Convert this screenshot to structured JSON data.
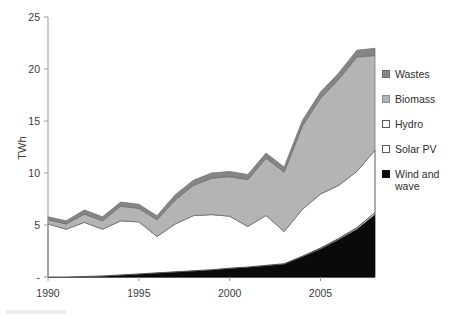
{
  "chart_data": {
    "type": "area",
    "title": "",
    "subtitle": "",
    "xlabel": "",
    "ylabel": "TWh",
    "stacked": true,
    "grid": false,
    "legend_position": "right",
    "xlim": [
      1990,
      2008
    ],
    "ylim": [
      0,
      25
    ],
    "ytick_labels": [
      "25",
      "20",
      "15",
      "10",
      "5",
      "-"
    ],
    "ytick_values": [
      25,
      20,
      15,
      10,
      5,
      0
    ],
    "xtick_labels": [
      "1990",
      "1995",
      "2000",
      "2005"
    ],
    "xtick_values": [
      1990,
      1995,
      2000,
      2005
    ],
    "x": [
      1990,
      1991,
      1992,
      1993,
      1994,
      1995,
      1996,
      1997,
      1998,
      1999,
      2000,
      2001,
      2002,
      2003,
      2004,
      2005,
      2006,
      2007,
      2008
    ],
    "series": [
      {
        "name": "Wind and wave",
        "color": "#0a0a0a",
        "values": [
          0.0,
          0.0,
          0.05,
          0.1,
          0.2,
          0.3,
          0.4,
          0.5,
          0.6,
          0.7,
          0.85,
          0.95,
          1.1,
          1.25,
          1.95,
          2.7,
          3.6,
          4.6,
          6.0
        ]
      },
      {
        "name": "Solar PV",
        "color": "#ffffff",
        "values": [
          0.0,
          0.0,
          0.0,
          0.0,
          0.0,
          0.0,
          0.0,
          0.0,
          0.0,
          0.0,
          0.0,
          0.01,
          0.02,
          0.03,
          0.05,
          0.08,
          0.11,
          0.15,
          0.2
        ]
      },
      {
        "name": "Hydro",
        "color": "#ffffff",
        "values": [
          5.1,
          4.6,
          5.2,
          4.5,
          5.2,
          5.0,
          3.5,
          4.6,
          5.3,
          5.3,
          5.0,
          3.9,
          4.8,
          3.1,
          4.5,
          5.2,
          5.1,
          5.4,
          6.0
        ]
      },
      {
        "name": "Biomass",
        "color": "#b4b4b4",
        "values": [
          0.4,
          0.5,
          0.8,
          0.8,
          1.4,
          1.3,
          1.6,
          2.3,
          2.9,
          3.5,
          3.8,
          4.5,
          5.5,
          5.7,
          8.0,
          9.2,
          10.2,
          11.0,
          9.1
        ]
      },
      {
        "name": "Wastes",
        "color": "#858585",
        "values": [
          0.3,
          0.3,
          0.4,
          0.4,
          0.4,
          0.4,
          0.4,
          0.5,
          0.5,
          0.5,
          0.5,
          0.5,
          0.5,
          0.5,
          0.55,
          0.6,
          0.6,
          0.65,
          0.7
        ]
      }
    ],
    "totals": [
      5.8,
      5.4,
      6.45,
      5.8,
      7.2,
      7.0,
      5.9,
      7.9,
      9.3,
      10.0,
      10.15,
      9.86,
      11.92,
      10.58,
      15.05,
      17.78,
      19.61,
      21.8,
      22.0
    ]
  },
  "axis": {
    "y_title": "TWh",
    "y_ticks": [
      "25",
      "20",
      "15",
      "10",
      "5",
      "-"
    ],
    "x_ticks": [
      "1990",
      "1995",
      "2000",
      "2005"
    ]
  },
  "legend": {
    "items": [
      {
        "label": "Wastes",
        "swatch": "filled-dark-gray",
        "color": "#858585",
        "border": "#6f6f6f"
      },
      {
        "label": "Biomass",
        "swatch": "filled-light-gray",
        "color": "#b4b4b4",
        "border": "#8a8a8a"
      },
      {
        "label": "Hydro",
        "swatch": "outline-white",
        "color": "#ffffff",
        "border": "#5a5a5a"
      },
      {
        "label": "Solar PV",
        "swatch": "outline-white",
        "color": "#ffffff",
        "border": "#5a5a5a"
      },
      {
        "label": "Wind and\nwave",
        "swatch": "filled-black",
        "color": "#0a0a0a",
        "border": "#0a0a0a"
      }
    ]
  }
}
